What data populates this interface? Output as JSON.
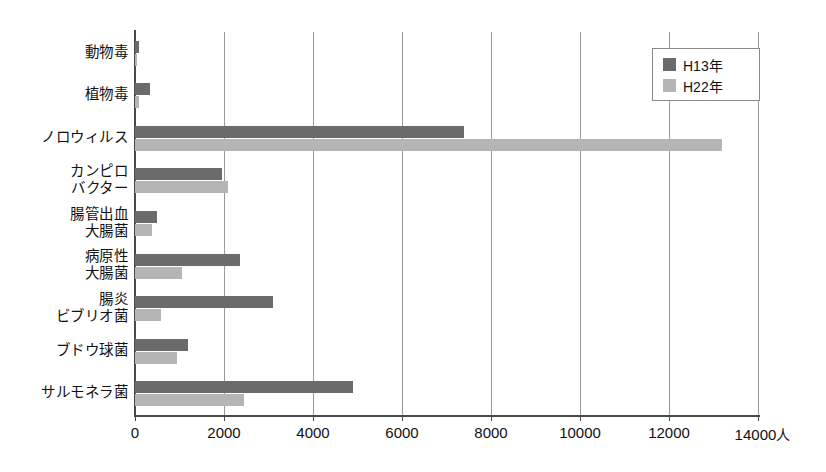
{
  "chart_data": {
    "type": "bar",
    "orientation": "horizontal",
    "title": "",
    "subtitle": "",
    "xlabel": "",
    "ylabel": "",
    "xlim": [
      0,
      14000
    ],
    "xticks": [
      0,
      2000,
      4000,
      6000,
      8000,
      10000,
      12000,
      14000
    ],
    "xtick_labels": [
      "0",
      "2000",
      "4000",
      "6000",
      "8000",
      "10000",
      "12000",
      "14000"
    ],
    "x_unit_suffix": "人",
    "grid": "vertical",
    "legend_position": "top-right",
    "categories": [
      "動物毒",
      "植物毒",
      "ノロウィルス",
      "カンピロ\nバクター",
      "腸管出血\n大腸菌",
      "病原性\n大腸菌",
      "腸炎\nビブリオ菌",
      "ブドウ球菌",
      "サルモネラ菌"
    ],
    "series": [
      {
        "name": "H13年",
        "color": "#6b6b6b",
        "values": [
          100,
          330,
          7400,
          1950,
          500,
          2350,
          3100,
          1180,
          4900
        ]
      },
      {
        "name": "H22年",
        "color": "#b5b5b5",
        "values": [
          50,
          90,
          13200,
          2100,
          380,
          1050,
          580,
          950,
          2450
        ]
      }
    ]
  },
  "legend": {
    "items": [
      {
        "label": "H13年",
        "color": "#6b6b6b"
      },
      {
        "label": "H22年",
        "color": "#b5b5b5"
      }
    ]
  },
  "colors": {
    "series_h13": "#6b6b6b",
    "series_h22": "#b5b5b5",
    "axis": "#4a4a4a",
    "grid": "#9a9a9a",
    "background": "#ffffff"
  }
}
